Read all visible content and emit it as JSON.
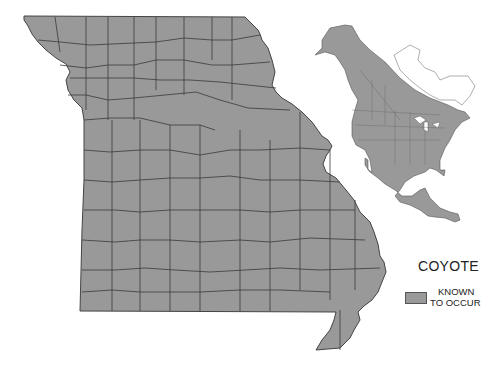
{
  "map": {
    "title": "COYOTE",
    "state": "Missouri",
    "inset": "North America range",
    "fill_color": "#999999",
    "border_color": "#3a3a3a"
  },
  "legend": {
    "title": "COYOTE",
    "items": [
      {
        "label_line1": "KNOWN",
        "label_line2": "TO OCCUR",
        "color": "#999999"
      }
    ]
  }
}
